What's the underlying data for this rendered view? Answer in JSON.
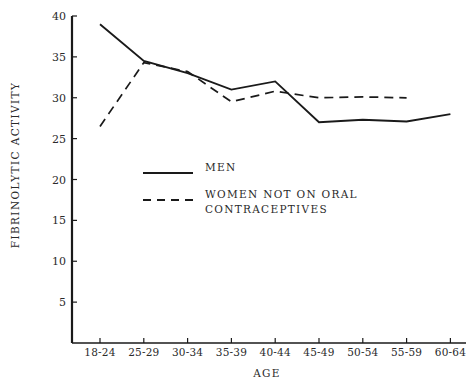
{
  "chart_data": {
    "type": "line",
    "title": "",
    "xlabel": "AGE",
    "ylabel": "FIBRINOLYTIC ACTIVITY",
    "categories": [
      "18-24",
      "25-29",
      "30-34",
      "35-39",
      "40-44",
      "45-49",
      "50-54",
      "55-59",
      "60-64"
    ],
    "ylim": [
      0,
      40
    ],
    "yticks": [
      5,
      10,
      15,
      20,
      25,
      30,
      35,
      40
    ],
    "grid": false,
    "legend_position": "inside-center",
    "series": [
      {
        "name": "MEN",
        "style": "solid",
        "color": "#1a1a1a",
        "values": [
          39.0,
          34.5,
          33.0,
          31.0,
          32.0,
          27.0,
          27.3,
          27.1,
          28.0
        ]
      },
      {
        "name": "WOMEN NOT ON ORAL CONTRACEPTIVES",
        "style": "dashed",
        "color": "#1a1a1a",
        "values": [
          26.5,
          34.3,
          33.2,
          29.5,
          30.8,
          30.0,
          30.1,
          30.0,
          null
        ]
      }
    ]
  },
  "legend": {
    "items": [
      {
        "label": "MEN",
        "style": "solid"
      },
      {
        "label": "WOMEN NOT ON ORAL\n  CONTRACEPTIVES",
        "style": "dashed"
      }
    ]
  },
  "axes": {
    "y_title": "FIBRINOLYTIC ACTIVITY",
    "x_title": "AGE"
  }
}
